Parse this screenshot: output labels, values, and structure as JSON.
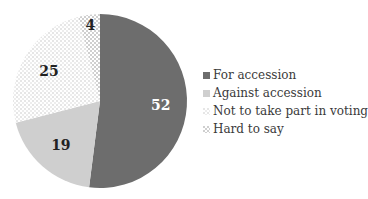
{
  "chart_data": {
    "type": "pie",
    "title": "",
    "categories": [
      "For accession",
      "Against accession",
      "Not to take part in voting",
      "Hard to say"
    ],
    "values": [
      52,
      19,
      25,
      4
    ],
    "data_labels": [
      "52",
      "19",
      "25",
      "4"
    ],
    "start_angle_deg": 0,
    "direction": "clockwise",
    "legend_position": "right",
    "colors": [
      "#6d6d6d",
      "#cfcfcf",
      "dotted-light",
      "checker-light"
    ]
  },
  "legend": {
    "items": [
      {
        "label": "For accession"
      },
      {
        "label": "Against accession"
      },
      {
        "label": "Not to take part in voting"
      },
      {
        "label": "Hard to say"
      }
    ]
  }
}
